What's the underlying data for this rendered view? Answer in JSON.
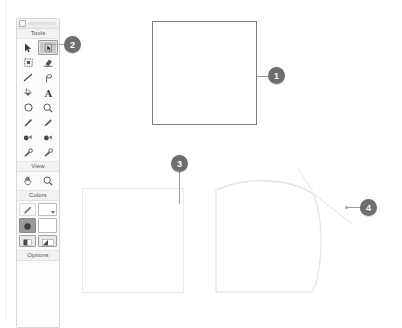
{
  "app": {
    "palette_title": "Tools palette",
    "sections": {
      "tools_label": "Tools",
      "view_label": "View",
      "colors_label": "Colors",
      "options_label": "Options"
    },
    "tools": [
      {
        "name": "pointer-tool",
        "icon": "cursor-arrow-icon",
        "selected": false
      },
      {
        "name": "free-form-select-tool",
        "icon": "lasso-select-icon",
        "selected": true
      },
      {
        "name": "rectangle-select-tool",
        "icon": "rectangle-select-icon",
        "selected": false
      },
      {
        "name": "eraser-tool",
        "icon": "eraser-icon",
        "selected": false
      },
      {
        "name": "line-tool",
        "icon": "line-icon",
        "selected": false
      },
      {
        "name": "curve-tool",
        "icon": "curve-icon",
        "selected": false
      },
      {
        "name": "fill-tool",
        "icon": "paint-bucket-icon",
        "selected": false
      },
      {
        "name": "text-tool",
        "icon": "text-a-icon",
        "selected": false
      },
      {
        "name": "ellipse-tool",
        "icon": "ellipse-icon",
        "selected": false
      },
      {
        "name": "magnifier-tool",
        "icon": "magnifier-icon",
        "selected": false
      },
      {
        "name": "pencil-tool",
        "icon": "pencil-icon",
        "selected": false
      },
      {
        "name": "brush-tool",
        "icon": "paintbrush-icon",
        "selected": false
      },
      {
        "name": "airbrush-tool",
        "icon": "airbrush-icon",
        "selected": false
      },
      {
        "name": "stamp-tool",
        "icon": "stamp-icon",
        "selected": false
      },
      {
        "name": "eyedropper-tool",
        "icon": "eyedropper-icon",
        "selected": false
      },
      {
        "name": "clone-tool",
        "icon": "clone-icon",
        "selected": false
      }
    ],
    "view_tools": [
      {
        "name": "pan-tool",
        "icon": "hand-pan-icon"
      },
      {
        "name": "zoom-tool",
        "icon": "magnifier-icon"
      }
    ],
    "colors": {
      "pen_icon": "pen-nib-icon",
      "stroke_swatch": "#ffffff",
      "foreground": "#9a9a9a",
      "background": "#ffffff",
      "pattern_left_icon": "pattern-swatch-icon",
      "pattern_right_icon": "gradient-swatch-icon"
    }
  },
  "canvas": {
    "shapes": [
      {
        "name": "square-dark-outline",
        "stroke": "#7c7c7c"
      },
      {
        "name": "square-light-outline",
        "stroke": "#eaeaea"
      },
      {
        "name": "square-curved-top",
        "stroke": "#e4e4e4"
      }
    ]
  },
  "callouts": [
    {
      "id": "1",
      "label": "1",
      "target": "square-dark-outline"
    },
    {
      "id": "2",
      "label": "2",
      "target": "free-form-select-tool"
    },
    {
      "id": "3",
      "label": "3",
      "target": "square-light-outline"
    },
    {
      "id": "4",
      "label": "4",
      "target": "square-curved-top"
    }
  ]
}
